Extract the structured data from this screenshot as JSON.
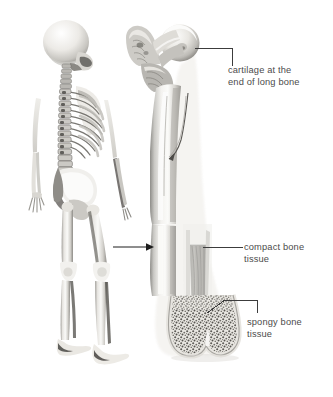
{
  "figure": {
    "background_color": "#ffffff",
    "text_color": "#4c4c4c",
    "leader_line_color": "#3c3c3c"
  },
  "illustrations": [
    {
      "name": "skeleton",
      "description": "full human skeleton, posterior three-quarter view, standing",
      "alt": "skeleton"
    },
    {
      "name": "femur",
      "description": "long bone (femur) shown in longitudinal section revealing internal tissue",
      "alt": "femur long bone cut away"
    }
  ],
  "labels": [
    {
      "id": "cartilage",
      "text": "cartilage at the\nend of long bone",
      "lines": [
        "cartilage at the",
        "end of long bone"
      ]
    },
    {
      "id": "compact",
      "text": "compact bone\ntissue",
      "lines": [
        "compact bone",
        "tissue"
      ]
    },
    {
      "id": "spongy",
      "text": "spongy bone\ntissue",
      "lines": [
        "spongy bone",
        "tissue"
      ]
    }
  ],
  "connector": {
    "name": "magnify-arrow",
    "description": "arrow pointing from skeleton femur to enlarged long bone"
  }
}
